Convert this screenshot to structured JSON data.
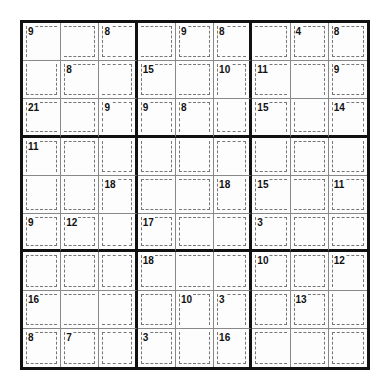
{
  "puzzle": {
    "type": "Killer Sudoku",
    "size": 9,
    "clues": [
      {
        "row": 0,
        "col": 0,
        "sum": "9"
      },
      {
        "row": 0,
        "col": 2,
        "sum": "8"
      },
      {
        "row": 0,
        "col": 4,
        "sum": "9"
      },
      {
        "row": 0,
        "col": 5,
        "sum": "8"
      },
      {
        "row": 0,
        "col": 7,
        "sum": "4"
      },
      {
        "row": 0,
        "col": 8,
        "sum": "8"
      },
      {
        "row": 1,
        "col": 1,
        "sum": "8"
      },
      {
        "row": 1,
        "col": 3,
        "sum": "15"
      },
      {
        "row": 1,
        "col": 5,
        "sum": "10"
      },
      {
        "row": 1,
        "col": 6,
        "sum": "11"
      },
      {
        "row": 1,
        "col": 8,
        "sum": "9"
      },
      {
        "row": 2,
        "col": 0,
        "sum": "21"
      },
      {
        "row": 2,
        "col": 2,
        "sum": "9"
      },
      {
        "row": 2,
        "col": 3,
        "sum": "9"
      },
      {
        "row": 2,
        "col": 4,
        "sum": "8"
      },
      {
        "row": 2,
        "col": 6,
        "sum": "15"
      },
      {
        "row": 2,
        "col": 8,
        "sum": "14"
      },
      {
        "row": 3,
        "col": 0,
        "sum": "11"
      },
      {
        "row": 4,
        "col": 2,
        "sum": "18"
      },
      {
        "row": 4,
        "col": 5,
        "sum": "18"
      },
      {
        "row": 4,
        "col": 6,
        "sum": "15"
      },
      {
        "row": 4,
        "col": 8,
        "sum": "11"
      },
      {
        "row": 5,
        "col": 0,
        "sum": "9"
      },
      {
        "row": 5,
        "col": 1,
        "sum": "12"
      },
      {
        "row": 5,
        "col": 3,
        "sum": "17"
      },
      {
        "row": 5,
        "col": 6,
        "sum": "3"
      },
      {
        "row": 6,
        "col": 3,
        "sum": "18"
      },
      {
        "row": 6,
        "col": 6,
        "sum": "10"
      },
      {
        "row": 6,
        "col": 8,
        "sum": "12"
      },
      {
        "row": 7,
        "col": 0,
        "sum": "16"
      },
      {
        "row": 7,
        "col": 4,
        "sum": "10"
      },
      {
        "row": 7,
        "col": 5,
        "sum": "3"
      },
      {
        "row": 7,
        "col": 7,
        "sum": "13"
      },
      {
        "row": 8,
        "col": 0,
        "sum": "8"
      },
      {
        "row": 8,
        "col": 1,
        "sum": "7"
      },
      {
        "row": 8,
        "col": 3,
        "sum": "3"
      },
      {
        "row": 8,
        "col": 5,
        "sum": "16"
      }
    ],
    "cage_map": [
      "AABBCDDEF",
      "AGGHHIJJK",
      "LLMNOIPJQ",
      "RSMNOTPUQ",
      "RSVWWTXXY",
      "Z1V2334Y5",
      "6718889#@",
      "$$$7%^&*@",
      "()(!%^++="
    ]
  }
}
